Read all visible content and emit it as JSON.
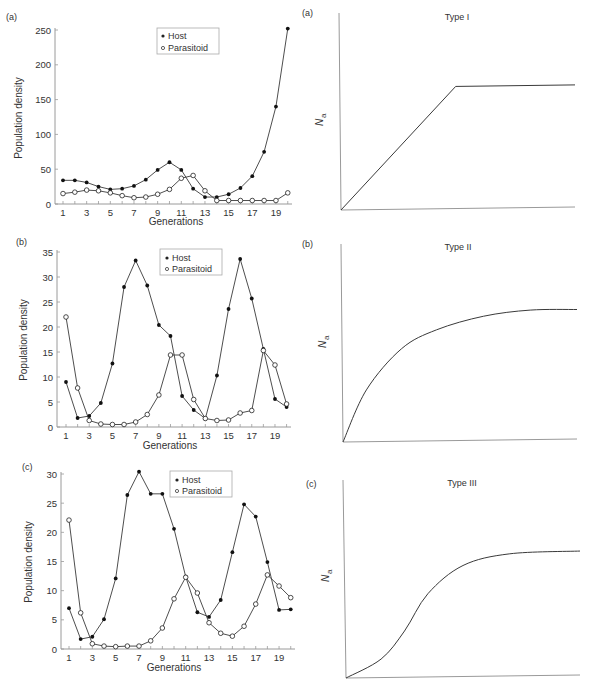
{
  "chart_data": [
    {
      "panel": "(a)",
      "type": "line",
      "title": "",
      "xlabel": "Generations",
      "ylabel": "Population density",
      "ylim": [
        0,
        250
      ],
      "yticks": [
        0,
        50,
        100,
        150,
        200,
        250
      ],
      "xticks": [
        1,
        3,
        5,
        7,
        9,
        11,
        13,
        15,
        17,
        19
      ],
      "x": [
        1,
        2,
        3,
        4,
        5,
        6,
        7,
        8,
        9,
        10,
        11,
        12,
        13,
        14,
        15,
        16,
        17,
        18,
        19,
        20
      ],
      "legend": [
        "Host",
        "Parasitoid"
      ],
      "legend_position": "top-center",
      "series": [
        {
          "name": "Host",
          "marker": "filled-circle",
          "values": [
            34,
            34,
            31,
            25,
            21,
            22,
            26,
            35,
            49,
            60,
            49,
            22,
            10,
            10,
            14,
            23,
            40,
            75,
            140,
            252
          ]
        },
        {
          "name": "Parasitoid",
          "marker": "open-circle",
          "values": [
            15,
            17,
            20,
            19,
            16,
            12,
            9,
            10,
            14,
            21,
            37,
            41,
            19,
            5,
            5,
            5,
            5,
            5,
            5,
            16
          ]
        }
      ]
    },
    {
      "panel": "(b)",
      "type": "line",
      "title": "",
      "xlabel": "Generations",
      "ylabel": "Population density",
      "ylim": [
        0,
        35
      ],
      "yticks": [
        0,
        5,
        10,
        15,
        20,
        25,
        30,
        35
      ],
      "xticks": [
        1,
        3,
        5,
        7,
        9,
        11,
        13,
        15,
        17,
        19
      ],
      "x": [
        1,
        2,
        3,
        4,
        5,
        6,
        7,
        8,
        9,
        10,
        11,
        12,
        13,
        14,
        15,
        16,
        17,
        18,
        19,
        20
      ],
      "legend": [
        "Host",
        "Parasitoid"
      ],
      "legend_position": "top-right",
      "series": [
        {
          "name": "Host",
          "marker": "filled-circle",
          "values": [
            9,
            1.8,
            2.2,
            4.8,
            12.7,
            28,
            33.3,
            28.3,
            20.4,
            18.2,
            6.2,
            3.4,
            1.7,
            10.3,
            23.6,
            33.6,
            25.7,
            15.6,
            5.6,
            4
          ]
        },
        {
          "name": "Parasitoid",
          "marker": "open-circle",
          "values": [
            22,
            7.8,
            1.3,
            0.6,
            0.5,
            0.5,
            1,
            2.5,
            6.4,
            14.4,
            14.4,
            5.5,
            1.7,
            1.3,
            1.4,
            2.8,
            3.3,
            15.3,
            12.4,
            4.6
          ]
        }
      ]
    },
    {
      "panel": "(c)",
      "type": "line",
      "title": "",
      "xlabel": "Generations",
      "ylabel": "Population density",
      "ylim": [
        0,
        30
      ],
      "yticks": [
        0,
        5,
        10,
        15,
        20,
        25,
        30
      ],
      "xticks": [
        1,
        3,
        5,
        7,
        9,
        11,
        13,
        15,
        17,
        19
      ],
      "x": [
        1,
        2,
        3,
        4,
        5,
        6,
        7,
        8,
        9,
        10,
        11,
        12,
        13,
        14,
        15,
        16,
        17,
        18,
        19,
        20
      ],
      "legend": [
        "Host",
        "Parasitoid"
      ],
      "legend_position": "top-right",
      "series": [
        {
          "name": "Host",
          "marker": "filled-circle",
          "values": [
            7,
            1.7,
            2.1,
            5.1,
            12.1,
            26.4,
            30.4,
            26.6,
            26.6,
            20.6,
            12.4,
            6.3,
            5.5,
            8.4,
            16.6,
            24.8,
            22.7,
            14.9,
            6.7,
            6.8
          ]
        },
        {
          "name": "Parasitoid",
          "marker": "open-circle",
          "values": [
            22.1,
            6.2,
            0.9,
            0.5,
            0.4,
            0.5,
            0.5,
            1.4,
            3.6,
            8.6,
            12.3,
            9.6,
            4.5,
            2.7,
            2.2,
            3.9,
            7.7,
            12.7,
            10.8,
            8.8
          ]
        }
      ]
    },
    {
      "panel": "(a)",
      "type": "line",
      "title": "Type I",
      "xlabel": "",
      "ylabel": "Na",
      "grid": false,
      "shape": "linear rise then plateau",
      "x": [
        0,
        0.49,
        1.0
      ],
      "values": [
        0,
        0.66,
        0.66
      ]
    },
    {
      "panel": "(b)",
      "type": "line",
      "title": "Type II",
      "xlabel": "",
      "ylabel": "Na",
      "grid": false,
      "shape": "decelerating saturating curve",
      "x": [
        0,
        0.1,
        0.25,
        0.4,
        0.6,
        0.8,
        1.0
      ],
      "values": [
        0,
        0.28,
        0.5,
        0.6,
        0.67,
        0.7,
        0.7
      ]
    },
    {
      "panel": "(c)",
      "type": "line",
      "title": "Type III",
      "xlabel": "",
      "ylabel": "Na",
      "grid": false,
      "shape": "sigmoid",
      "x": [
        0,
        0.15,
        0.25,
        0.35,
        0.5,
        0.7,
        1.0
      ],
      "values": [
        0,
        0.1,
        0.25,
        0.45,
        0.6,
        0.66,
        0.67
      ]
    }
  ],
  "panels": {
    "left": [
      {
        "label": "(a)",
        "legend_host": "Host",
        "legend_parasitoid": "Parasitoid",
        "xlabel": "Generations",
        "ylabel": "Population density"
      },
      {
        "label": "(b)",
        "legend_host": "Host",
        "legend_parasitoid": "Parasitoid",
        "xlabel": "Generations",
        "ylabel": "Population density"
      },
      {
        "label": "(c)",
        "legend_host": "Host",
        "legend_parasitoid": "Parasitoid",
        "xlabel": "Generations",
        "ylabel": "Population density"
      }
    ],
    "right": [
      {
        "label": "(a)",
        "title": "Type I",
        "ylabel_main": "N",
        "ylabel_sub": "a"
      },
      {
        "label": "(b)",
        "title": "Type II",
        "ylabel_main": "N",
        "ylabel_sub": "a"
      },
      {
        "label": "(c)",
        "title": "Type III",
        "ylabel_main": "N",
        "ylabel_sub": "a"
      }
    ]
  },
  "colors": {
    "line": "#3a3a3a",
    "axis": "#9a9a9a",
    "text": "#333333",
    "background": "#ffffff"
  }
}
